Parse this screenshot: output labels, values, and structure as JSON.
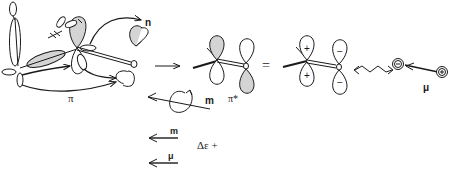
{
  "figure": {
    "labels": {
      "n_orbital": "n",
      "pi_orbital": "π",
      "pi_star_orbital": "π*",
      "equals": "=",
      "magnetic_moment_rotation": "m",
      "magnetic_moment": "m",
      "electric_moment": "μ",
      "dipole_label": "μ",
      "delta_epsilon": "Δε +",
      "oxygen_atom": "O",
      "plus_sign": "+",
      "minus_sign": "−"
    },
    "colors": {
      "line": "#1a1a1a",
      "shaded_lobe": "#d4d4d4",
      "background": "#ffffff"
    }
  }
}
